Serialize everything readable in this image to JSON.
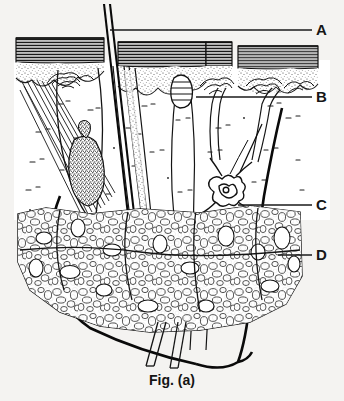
{
  "figure": {
    "caption": "Fig. (a)",
    "background_color": "#f4f3f1",
    "ink_color": "#161616",
    "width": 344,
    "height": 401
  },
  "labels": [
    {
      "id": "A",
      "text": "A",
      "x": 318,
      "y": 23,
      "leader": {
        "x1": 110,
        "y1": 30,
        "x2": 312,
        "y2": 30
      },
      "refers_to": "hair-shaft"
    },
    {
      "id": "B",
      "text": "B",
      "x": 318,
      "y": 90,
      "leader": {
        "x1": 196,
        "y1": 97,
        "x2": 312,
        "y2": 97
      },
      "refers_to": "sensory-receptor-epidermis"
    },
    {
      "id": "C",
      "text": "C",
      "x": 318,
      "y": 198,
      "leader": {
        "x1": 238,
        "y1": 205,
        "x2": 312,
        "y2": 205
      },
      "refers_to": "sweat-gland-coil"
    },
    {
      "id": "D",
      "text": "D",
      "x": 318,
      "y": 248,
      "leader": {
        "x1": 278,
        "y1": 255,
        "x2": 312,
        "y2": 255
      },
      "refers_to": "subcutaneous-fat-layer"
    }
  ],
  "structures": [
    {
      "name": "epidermis",
      "description": "dark horizontally hatched surface band"
    },
    {
      "name": "stippled-layer",
      "description": "stippled granular layer beneath epidermis"
    },
    {
      "name": "dermis",
      "description": "pale region with dashed fibre marks and wavy papillae"
    },
    {
      "name": "hair-shaft",
      "description": "two parallel black lines rising above skin surface"
    },
    {
      "name": "hair-follicle",
      "description": "tubular sheath descending to bulb"
    },
    {
      "name": "hair-bulb",
      "description": "solid black bulb at follicle base"
    },
    {
      "name": "sebaceous-gland",
      "description": "dark stippled lobed gland on follicle"
    },
    {
      "name": "arrector-pili-muscle",
      "description": "diagonal striated fibre bundle"
    },
    {
      "name": "sweat-gland-coil",
      "description": "tangled coiled tubule"
    },
    {
      "name": "sweat-duct",
      "description": "long tube from coil to surface pore"
    },
    {
      "name": "subcutaneous-fat",
      "description": "mass of rounded adipocyte outlines"
    },
    {
      "name": "nerve-vessel-bundle",
      "description": "thick black curved lines exiting below"
    }
  ]
}
